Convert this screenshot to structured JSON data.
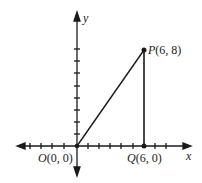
{
  "diagram": {
    "type": "coordinate-plane-triangle",
    "axes": {
      "x_label": "x",
      "y_label": "y",
      "x_ticks_left": 5,
      "x_ticks_right": 8,
      "y_ticks_up": 8
    },
    "points": [
      {
        "name": "O",
        "coords": "(0, 0)",
        "x": 0,
        "y": 0
      },
      {
        "name": "P",
        "coords": "(6, 8)",
        "x": 6,
        "y": 8
      },
      {
        "name": "Q",
        "coords": "(6, 0)",
        "x": 6,
        "y": 0
      }
    ],
    "segments": [
      {
        "from": "O",
        "to": "P"
      },
      {
        "from": "P",
        "to": "Q"
      }
    ],
    "colors": {
      "ink": "#1a1a1a",
      "background": "#ffffff"
    }
  }
}
